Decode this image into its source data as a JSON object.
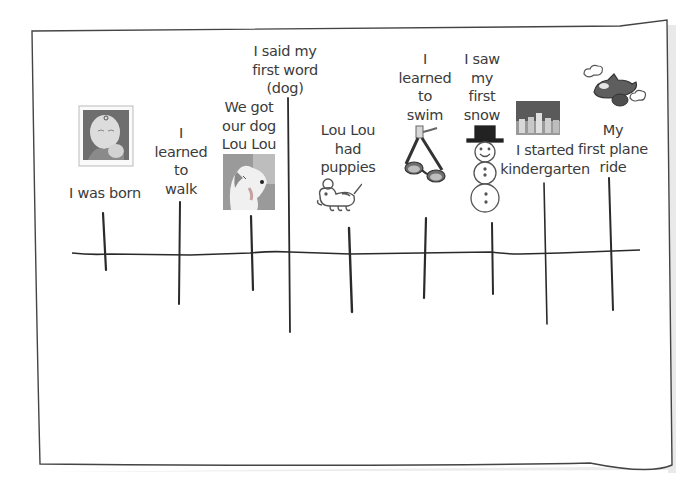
{
  "timeline": {
    "events": [
      {
        "id": "born",
        "lines": [
          "I was born"
        ],
        "icon": "baby-photo-icon"
      },
      {
        "id": "walk",
        "lines": [
          "I",
          "learned",
          "to",
          "walk"
        ],
        "icon": null
      },
      {
        "id": "dog",
        "lines": [
          "We got",
          "our dog",
          "Lou Lou"
        ],
        "icon": "dog-photo-icon"
      },
      {
        "id": "first-word",
        "lines": [
          "I said my",
          "first word",
          "(dog)"
        ],
        "icon": null
      },
      {
        "id": "puppies",
        "lines": [
          "Lou Lou",
          "had",
          "puppies"
        ],
        "icon": "puppy-icon"
      },
      {
        "id": "swim",
        "lines": [
          "I",
          "learned",
          "to",
          "swim"
        ],
        "icon": "swim-goggles-icon"
      },
      {
        "id": "snow",
        "lines": [
          "I saw",
          "my",
          "first",
          "snow"
        ],
        "icon": "snowman-icon"
      },
      {
        "id": "kindergarten",
        "lines": [
          "I started",
          "kindergarten"
        ],
        "icon": "school-photo-icon"
      },
      {
        "id": "plane",
        "lines": [
          "My",
          "first plane",
          "ride"
        ],
        "icon": "airplane-icon"
      }
    ]
  },
  "colors": {
    "ink": "#2a2a2a",
    "text": "#3b3b3b",
    "paper": "#ffffff",
    "shadow": "#e4e4e4"
  }
}
